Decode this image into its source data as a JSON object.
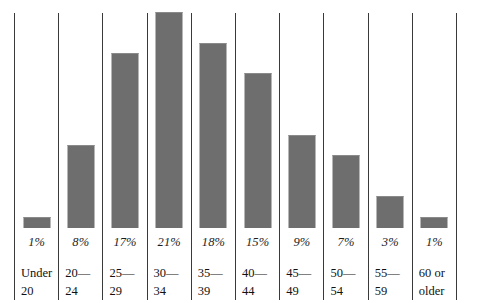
{
  "chart_data": {
    "type": "bar",
    "title": "",
    "subtitle": "",
    "xlabel": "",
    "ylabel": "",
    "grid": false,
    "legend": "none",
    "ylim": [
      0,
      21
    ],
    "axis_visible": {
      "left_rule": true,
      "right_rule": true,
      "baseline": false,
      "column_rules": true
    },
    "bar_color": "#6e6e6e",
    "rule_color": "#3a3a3a",
    "text_color": "#111111",
    "value_suffix": "%",
    "categories": [
      "Under\n20",
      "20—24",
      "25—29",
      "30—34",
      "35—39",
      "40—44",
      "45—49",
      "50—54",
      "55—59",
      "60 or\nolder"
    ],
    "values": [
      1,
      8,
      17,
      21,
      18,
      15,
      9,
      7,
      3,
      1
    ],
    "value_labels": [
      "1%",
      "8%",
      "17%",
      "21%",
      "18%",
      "15%",
      "9%",
      "7%",
      "3%",
      "1%"
    ]
  },
  "chart": {
    "columns": [
      {
        "value_label": "1%",
        "value": 1,
        "category_label": "Under\n20"
      },
      {
        "value_label": "8%",
        "value": 8,
        "category_label": "20—24"
      },
      {
        "value_label": "17%",
        "value": 17,
        "category_label": "25—29"
      },
      {
        "value_label": "21%",
        "value": 21,
        "category_label": "30—34"
      },
      {
        "value_label": "18%",
        "value": 18,
        "category_label": "35—39"
      },
      {
        "value_label": "15%",
        "value": 15,
        "category_label": "40—44"
      },
      {
        "value_label": "9%",
        "value": 9,
        "category_label": "45—49"
      },
      {
        "value_label": "7%",
        "value": 7,
        "category_label": "50—54"
      },
      {
        "value_label": "3%",
        "value": 3,
        "category_label": "55—59"
      },
      {
        "value_label": "1%",
        "value": 1,
        "category_label": "60 or\nolder"
      }
    ]
  }
}
